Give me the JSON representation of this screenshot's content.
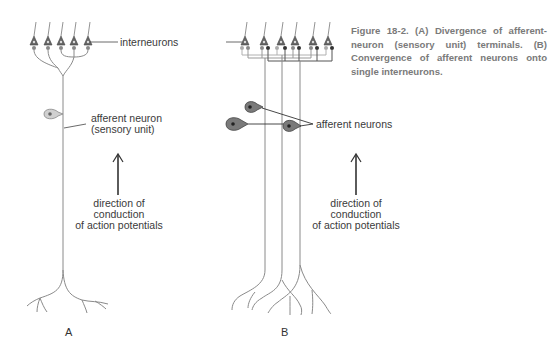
{
  "figure": {
    "caption": "Figure 18-2. (A) Divergence of afferent-neuron (sensory unit) terminals. (B) Convergence of afferent neurons onto single interneurons.",
    "shared_label": "interneurons",
    "panel_a": {
      "letter": "A",
      "neuron_label_line1": "afferent neuron",
      "neuron_label_line2": "(sensory unit)",
      "direction_line1": "direction of",
      "direction_line2": "conduction",
      "direction_line3": "of action potentials"
    },
    "panel_b": {
      "letter": "B",
      "neuron_label": "afferent neurons",
      "direction_line1": "direction of",
      "direction_line2": "conduction",
      "direction_line3": "of action potentials"
    }
  },
  "colors": {
    "line": "#8a8a8a",
    "dark": "#333333",
    "cell_light": "#c8c8c8",
    "cell_dark": "#7a7a7a",
    "caption": "#7a7a7a"
  }
}
